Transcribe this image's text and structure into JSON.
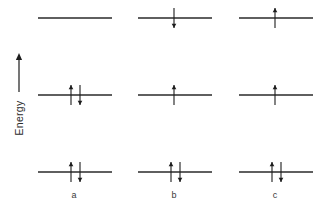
{
  "figure": {
    "type": "energy-level-diagram",
    "background_color": "#ffffff",
    "ink_color": "#1c1c1c",
    "axis": {
      "label": "Energy",
      "direction": "up",
      "arrow_icon": "up-arrow-icon",
      "x": 19,
      "arrow_top_y": 53,
      "arrow_bottom_y": 92,
      "label_center_y": 118
    },
    "geometry": {
      "level_line_width": 74,
      "level_rows_y": [
        18,
        95,
        172
      ],
      "column_centers_x": [
        75,
        175,
        276
      ],
      "label_y": 198,
      "electron_half_length": 10,
      "electron_offset_x": 4
    },
    "columns": [
      {
        "label": "a",
        "center_x": 75,
        "levels": [
          {
            "name": "upper-level",
            "y": 18,
            "electrons": []
          },
          {
            "name": "middle-level",
            "y": 95,
            "electrons": [
              "up",
              "down"
            ]
          },
          {
            "name": "lower-level",
            "y": 172,
            "electrons": [
              "up",
              "down"
            ]
          }
        ]
      },
      {
        "label": "b",
        "center_x": 175,
        "levels": [
          {
            "name": "upper-level",
            "y": 18,
            "electrons": [
              "down"
            ]
          },
          {
            "name": "middle-level",
            "y": 95,
            "electrons": [
              "up"
            ]
          },
          {
            "name": "lower-level",
            "y": 172,
            "electrons": [
              "up",
              "down"
            ]
          }
        ]
      },
      {
        "label": "c",
        "center_x": 276,
        "levels": [
          {
            "name": "upper-level",
            "y": 18,
            "electrons": [
              "up"
            ]
          },
          {
            "name": "middle-level",
            "y": 95,
            "electrons": [
              "up"
            ]
          },
          {
            "name": "lower-level",
            "y": 172,
            "electrons": [
              "up",
              "down"
            ]
          }
        ]
      }
    ]
  },
  "chart_data": {
    "type": "diagram",
    "title": "",
    "subtitle": "",
    "xlabel": "",
    "ylabel": "Energy",
    "x_tick_labels": [
      "a",
      "b",
      "c"
    ],
    "y_tick_labels": [],
    "grid": false,
    "legend": "none",
    "annotations": [],
    "categories": [
      "a",
      "b",
      "c"
    ],
    "levels": [
      "lower",
      "middle",
      "upper"
    ],
    "series": [
      {
        "name": "a",
        "values": [
          2,
          2,
          0
        ],
        "spins": [
          [
            "up",
            "down"
          ],
          [
            "up",
            "down"
          ],
          []
        ]
      },
      {
        "name": "b",
        "values": [
          2,
          1,
          1
        ],
        "spins": [
          [
            "up",
            "down"
          ],
          [
            "up"
          ],
          [
            "down"
          ]
        ]
      },
      {
        "name": "c",
        "values": [
          2,
          1,
          1
        ],
        "spins": [
          [
            "up",
            "down"
          ],
          [
            "up"
          ],
          [
            "up"
          ]
        ]
      }
    ]
  }
}
